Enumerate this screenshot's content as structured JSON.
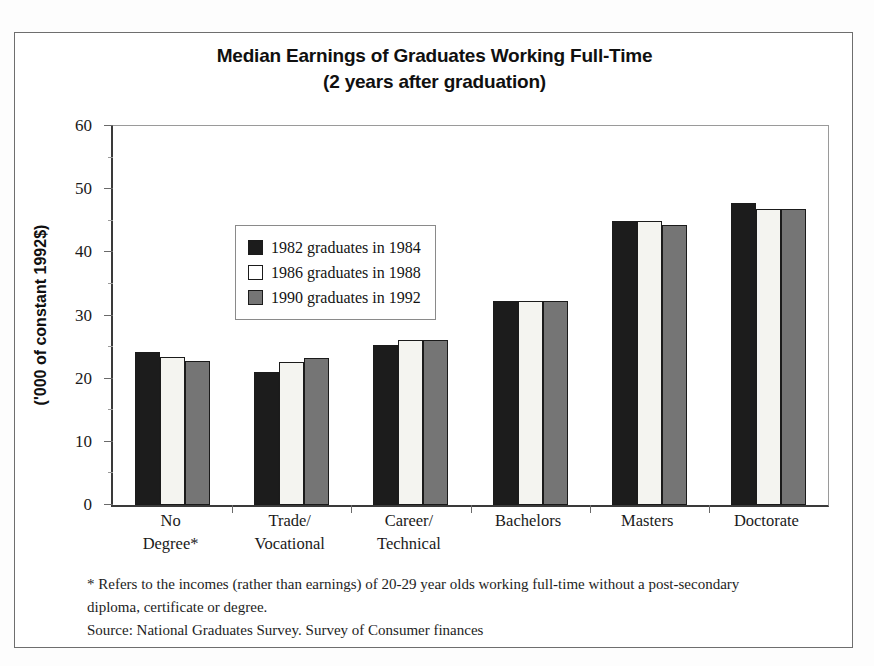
{
  "chart_data": {
    "type": "bar",
    "title": "Median Earnings of Graduates Working Full-Time",
    "subtitle": "(2 years after graduation)",
    "xlabel": "",
    "ylabel": "('000 of constant 1992$)",
    "ylim": [
      0,
      60
    ],
    "ytick_labels": [
      "0",
      "10",
      "20",
      "30",
      "40",
      "50",
      "60"
    ],
    "ytick_values": [
      0,
      10,
      20,
      30,
      40,
      50,
      60
    ],
    "grid": false,
    "legend_position": "upper-left inside plot",
    "categories": [
      "No Degree*",
      "Trade/ Vocational",
      "Career/ Technical",
      "Bachelors",
      "Masters",
      "Doctorate"
    ],
    "category_lines": [
      [
        "No",
        "Degree*"
      ],
      [
        "Trade/",
        "Vocational"
      ],
      [
        "Career/",
        "Technical"
      ],
      [
        "Bachelors",
        ""
      ],
      [
        "Masters",
        ""
      ],
      [
        "Doctorate",
        ""
      ]
    ],
    "series": [
      {
        "name": "1982 graduates in 1984",
        "color": "#1c1c1c",
        "values": [
          24.2,
          21.0,
          25.3,
          32.3,
          45.0,
          47.8
        ]
      },
      {
        "name": "1986 graduates in 1988",
        "color": "#f4f4f0",
        "values": [
          23.4,
          22.6,
          26.2,
          32.3,
          45.0,
          46.8
        ]
      },
      {
        "name": "1990 graduates in 1992",
        "color": "#757575",
        "values": [
          22.8,
          23.3,
          26.2,
          32.3,
          44.4,
          46.8
        ]
      }
    ],
    "annotations": [
      "* Refers to the incomes (rather than earnings) of 20-29 year olds working full-time without a post-secondary",
      "diploma, certificate or degree.",
      "Source:  National Graduates Survey.  Survey of Consumer finances"
    ]
  },
  "footnotes": {
    "line1": "* Refers to the incomes (rather than earnings) of 20-29 year olds working full-time without a post-secondary",
    "line2": "diploma, certificate or degree.",
    "line3": "Source:  National Graduates Survey.  Survey of Consumer finances"
  }
}
